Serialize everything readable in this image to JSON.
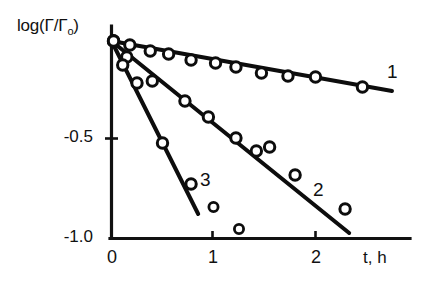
{
  "figure": {
    "background_color": "#ffffff",
    "ink_color": "#0d0d0d"
  },
  "axes": {
    "ylabel": "log(Γ/Γ",
    "ylabel_subscript": "o",
    "ylabel_close": ")",
    "xlabel": "t, h",
    "ytick_labels": [
      "-0.5",
      "-1.0"
    ],
    "xtick_labels": [
      "0",
      "1",
      "2"
    ]
  },
  "curve_labels": {
    "one": "1",
    "two": "2",
    "three": "3"
  },
  "chart_data": {
    "type": "scatter",
    "title": "",
    "xlabel": "t, h",
    "ylabel": "log(Γ/Γo)",
    "xlim": [
      0,
      3.1
    ],
    "ylim": [
      -1.0,
      0.02
    ],
    "xticks": [
      0,
      1,
      2
    ],
    "yticks": [
      -0.5,
      -1.0
    ],
    "grid": false,
    "legend": "inline-curve-numbers",
    "series": [
      {
        "name": "1",
        "label": "1",
        "marker": "open-circle",
        "fit_line": [
          [
            0.0,
            -0.015
          ],
          [
            2.75,
            -0.265
          ]
        ],
        "points": [
          [
            0.02,
            -0.015
          ],
          [
            0.18,
            -0.035
          ],
          [
            0.38,
            -0.065
          ],
          [
            0.56,
            -0.08
          ],
          [
            0.78,
            -0.11
          ],
          [
            1.02,
            -0.125
          ],
          [
            1.22,
            -0.145
          ],
          [
            1.47,
            -0.175
          ],
          [
            1.73,
            -0.19
          ],
          [
            2.0,
            -0.195
          ],
          [
            2.46,
            -0.245
          ]
        ]
      },
      {
        "name": "2",
        "label": "2",
        "marker": "open-circle",
        "fit_line": [
          [
            0.0,
            -0.015
          ],
          [
            2.33,
            -0.975
          ]
        ],
        "points": [
          [
            0.02,
            -0.015
          ],
          [
            0.15,
            -0.095
          ],
          [
            0.4,
            -0.215
          ],
          [
            0.72,
            -0.315
          ],
          [
            0.95,
            -0.395
          ],
          [
            1.22,
            -0.5
          ],
          [
            1.42,
            -0.565
          ],
          [
            1.55,
            -0.545
          ],
          [
            1.8,
            -0.685
          ],
          [
            2.29,
            -0.855
          ]
        ]
      },
      {
        "name": "3",
        "label": "3",
        "marker": "open-circle",
        "fit_line": [
          [
            0.0,
            -0.015
          ],
          [
            0.85,
            -0.88
          ]
        ],
        "points": [
          [
            0.02,
            -0.015
          ],
          [
            0.11,
            -0.135
          ],
          [
            0.25,
            -0.225
          ],
          [
            0.5,
            -0.525
          ],
          [
            0.78,
            -0.73
          ]
        ]
      }
    ],
    "unassigned_points": [
      [
        1.0,
        -0.845
      ],
      [
        1.25,
        -0.955
      ]
    ]
  }
}
